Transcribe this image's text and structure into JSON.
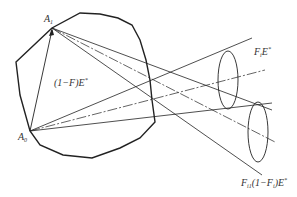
{
  "diagram": {
    "type": "radiation view-factor geometry",
    "points": {
      "A1": {
        "label": "A",
        "sub": "1"
      },
      "A0": {
        "label": "A",
        "sub": "0"
      }
    },
    "labels": {
      "inner": {
        "pre": "(1−F)E",
        "sup": "*"
      },
      "upper_cone": {
        "pre": "F",
        "sub": "i",
        "mid": "E",
        "sup": "*"
      },
      "lower_cone": {
        "pre": "F",
        "sub": "i1",
        "mid": "(1−F",
        "sub2": "i",
        "post": ")E",
        "sup": "*"
      }
    },
    "stroke_color": "#222222",
    "background": "#ffffff"
  }
}
